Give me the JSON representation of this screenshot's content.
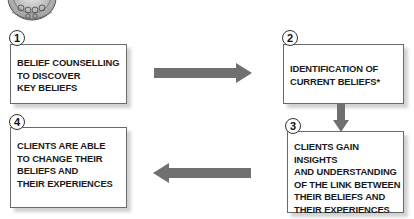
{
  "diagram": {
    "type": "process-cycle",
    "accent_color": "#6e6e6e",
    "steps": [
      {
        "number": "1",
        "text": "BELIEF COUNSELLING\nTO DISCOVER\nKEY BELIEFS"
      },
      {
        "number": "2",
        "text": "IDENTIFICATION OF\nCURRENT BELIEFS*"
      },
      {
        "number": "3",
        "text": "CLIENTS GAIN INSIGHTS\nAND UNDERSTANDING\nOF THE LINK BETWEEN\nTHEIR BELIEFS AND\nTHEIR EXPERIENCES"
      },
      {
        "number": "4",
        "text": "CLIENTS ARE ABLE\nTO CHANGE THEIR\nBELIEFS AND\nTHEIR EXPERIENCES"
      }
    ],
    "arrows": [
      {
        "from": "1",
        "to": "2",
        "direction": "right"
      },
      {
        "from": "2",
        "to": "3",
        "direction": "down"
      },
      {
        "from": "3",
        "to": "4",
        "direction": "left"
      }
    ],
    "logo_icon": "ornate-circular-emblem"
  }
}
